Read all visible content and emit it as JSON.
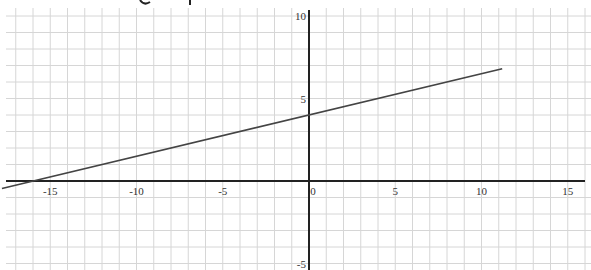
{
  "chart_data": {
    "type": "line",
    "title": "",
    "xlabel": "",
    "ylabel": "",
    "xlim": [
      -17.8,
      16.4
    ],
    "ylim": [
      -5.3,
      11.0
    ],
    "grid": true,
    "x_ticks": [
      -15,
      -10,
      -5,
      0,
      5,
      10,
      15
    ],
    "x_tick_labels": [
      "-15",
      "-10",
      "-5",
      "0",
      "5",
      "10",
      "15"
    ],
    "y_ticks": [
      -5,
      5,
      10
    ],
    "y_tick_labels": [
      "-5",
      "5",
      "10"
    ],
    "series": [
      {
        "name": "line",
        "equation": "y = 0.25x + 4",
        "slope": 0.25,
        "intercept": 4,
        "x": [
          -17.8,
          11.2
        ],
        "y": [
          -0.45,
          6.8
        ],
        "color": "#444444"
      }
    ],
    "axis_color": "#222222",
    "grid_color": "#d6d6d6"
  }
}
